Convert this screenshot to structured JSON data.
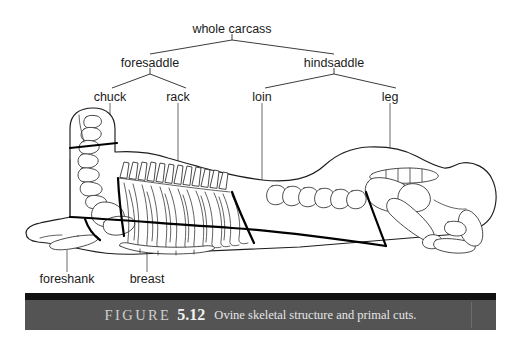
{
  "figure": {
    "caption_prefix": "FIGURE",
    "caption_number": "5.12",
    "caption_text": "Ovine skeletal structure and primal cuts.",
    "bar_color": "#545454",
    "bar_strip_color": "#111111",
    "text_color": "#e6e6e6",
    "line_color": "#1d1d1d"
  },
  "hierarchy": {
    "root": {
      "label": "whole carcass",
      "x": 232,
      "y": 29
    },
    "level2": [
      {
        "label": "foresaddle",
        "x": 150,
        "y": 63
      },
      {
        "label": "hindsaddle",
        "x": 334,
        "y": 63
      }
    ],
    "level3": [
      {
        "label": "chuck",
        "x": 110,
        "y": 97
      },
      {
        "label": "rack",
        "x": 178,
        "y": 97
      },
      {
        "label": "loin",
        "x": 262,
        "y": 97
      },
      {
        "label": "leg",
        "x": 390,
        "y": 97
      }
    ]
  },
  "bottom_labels": [
    {
      "label": "foreshank",
      "x": 67,
      "y": 279
    },
    {
      "label": "breast",
      "x": 147,
      "y": 279
    }
  ],
  "primal_cuts": [
    "chuck",
    "rack",
    "loin",
    "leg",
    "foreshank",
    "breast"
  ],
  "anatomy_regions": [
    "skull",
    "cervical-vertebrae",
    "thoracic-vertebrae",
    "lumbar-vertebrae",
    "rib-cage",
    "sternum",
    "scapula",
    "humerus",
    "foreleg-shank",
    "pelvis",
    "femur",
    "tibia",
    "hock"
  ]
}
